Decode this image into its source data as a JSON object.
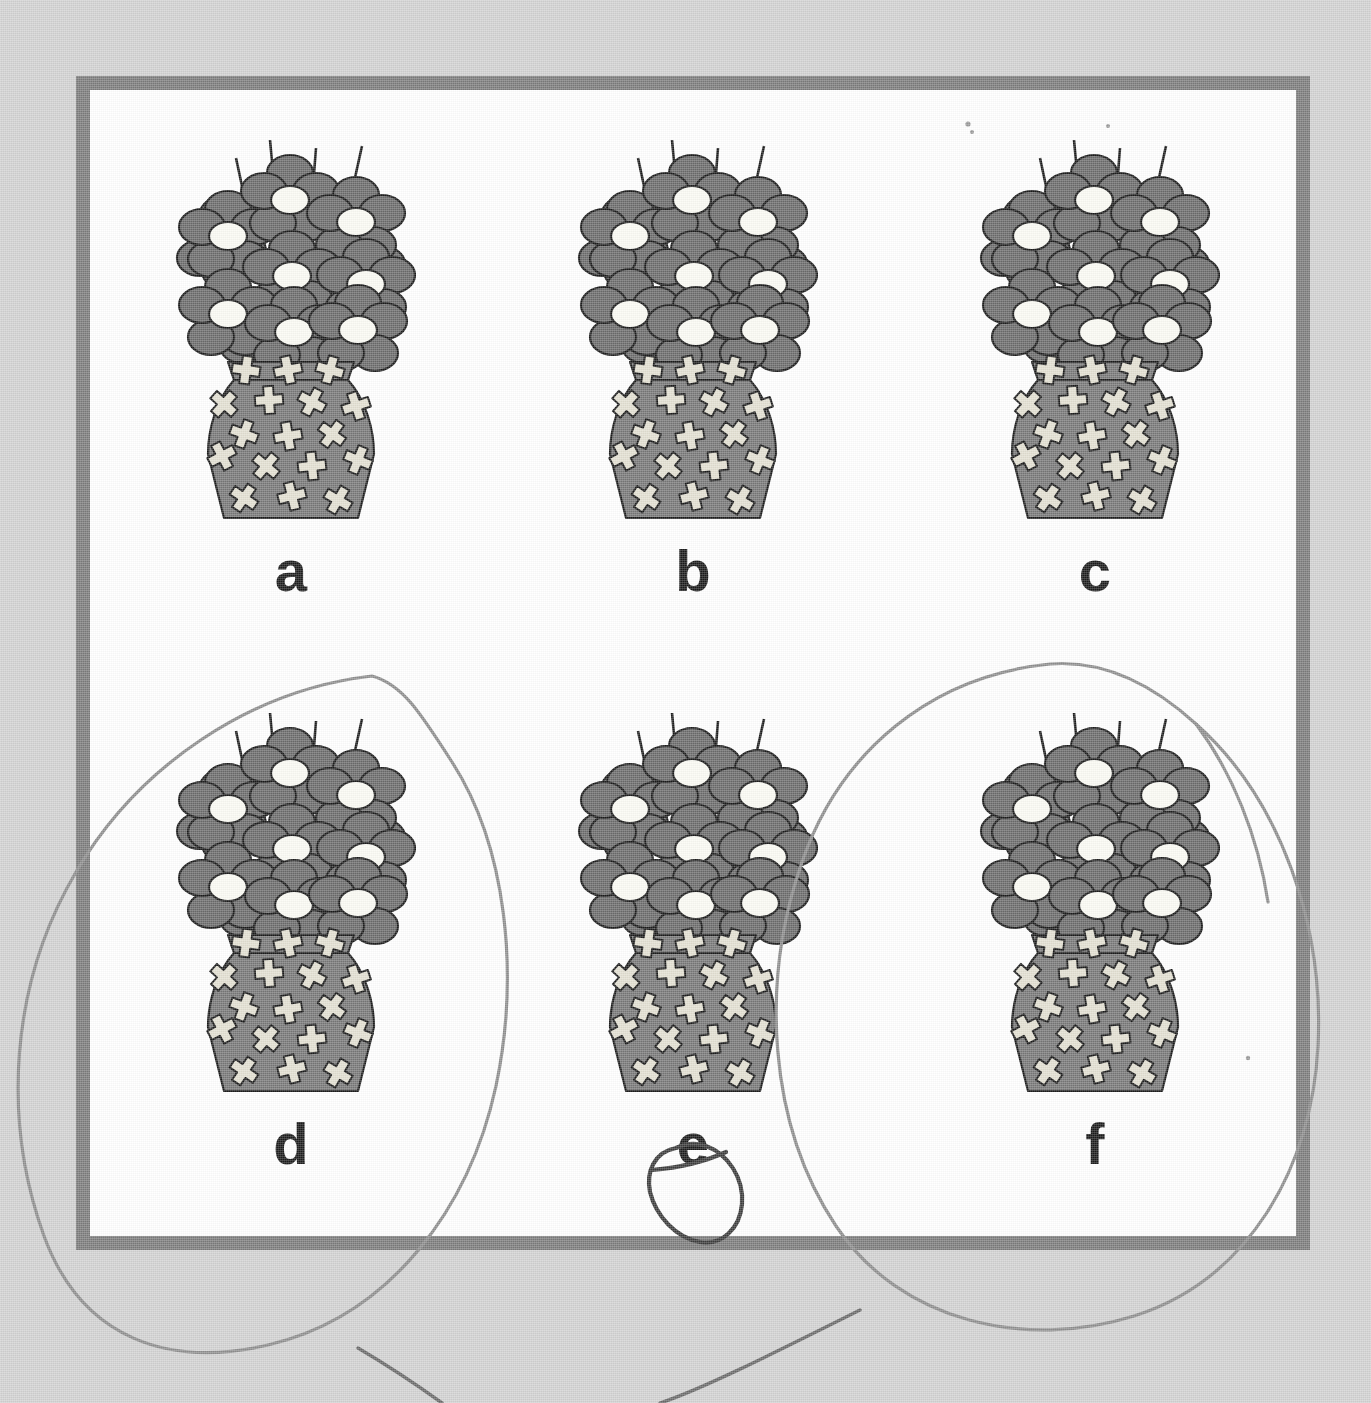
{
  "worksheet": {
    "title": "Matching pictures worksheet",
    "background_color": "#d2d2d2",
    "frame_border_color": "#7c7c7c",
    "frame_fill_color": "#ffffff"
  },
  "palette": {
    "flower_petal": "#6b6b6b",
    "flower_center": "#fbfbf4",
    "vase_body": "#787878",
    "vase_cross": "#e3e0d2",
    "outline": "#1c1c1c",
    "label_text": "#1b1b1b",
    "pencil_light": "#8e8e8e",
    "pencil_dark": "#3c3c3c"
  },
  "items": [
    {
      "id": "a",
      "label": "a",
      "icon": "flower-vase-icon",
      "selected": false,
      "row": 1,
      "col": 1
    },
    {
      "id": "b",
      "label": "b",
      "icon": "flower-vase-icon",
      "selected": false,
      "row": 1,
      "col": 2
    },
    {
      "id": "c",
      "label": "c",
      "icon": "flower-vase-icon",
      "selected": false,
      "row": 1,
      "col": 3
    },
    {
      "id": "d",
      "label": "d",
      "icon": "flower-vase-icon",
      "selected": true,
      "row": 2,
      "col": 1
    },
    {
      "id": "e",
      "label": "e",
      "icon": "flower-vase-icon",
      "selected": true,
      "row": 2,
      "col": 2
    },
    {
      "id": "f",
      "label": "f",
      "icon": "flower-vase-icon",
      "selected": true,
      "row": 2,
      "col": 3
    }
  ],
  "annotations": [
    {
      "name": "circle-around-d",
      "target": "d",
      "style": "light-pencil-ellipse",
      "note": "large hand-drawn ellipse enclosing item d, extending past the left frame edge"
    },
    {
      "name": "circle-around-e-label",
      "target": "e",
      "style": "dark-pencil-loop",
      "note": "small dark hand-drawn loop around the letter e only"
    },
    {
      "name": "circle-around-f",
      "target": "f",
      "style": "light-pencil-ellipse",
      "note": "large hand-drawn ellipse enclosing item f, extending past the right frame edge"
    },
    {
      "name": "stray-mark-lower-left",
      "target": null,
      "style": "stray-stroke",
      "note": "short pencil stroke below the frame"
    },
    {
      "name": "stray-mark-lower-center",
      "target": null,
      "style": "stray-stroke",
      "note": "short pencil stroke below the frame near center"
    }
  ]
}
